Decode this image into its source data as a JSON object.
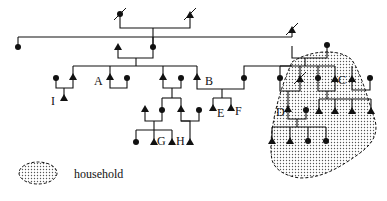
{
  "diagram": {
    "type": "kinship-diagram",
    "symbols": {
      "male": "filled-triangle",
      "female": "filled-circle",
      "deceased": "slash-through-symbol"
    },
    "person_labels": {
      "A": "A",
      "B": "B",
      "C": "C",
      "D": "D",
      "E": "E",
      "F": "F",
      "G": "G",
      "H": "H",
      "I": "I"
    },
    "legend": {
      "household_label": "household"
    },
    "colors": {
      "ink": "#111111",
      "household_fill": "#cfcfcf",
      "background": "#ffffff"
    }
  }
}
